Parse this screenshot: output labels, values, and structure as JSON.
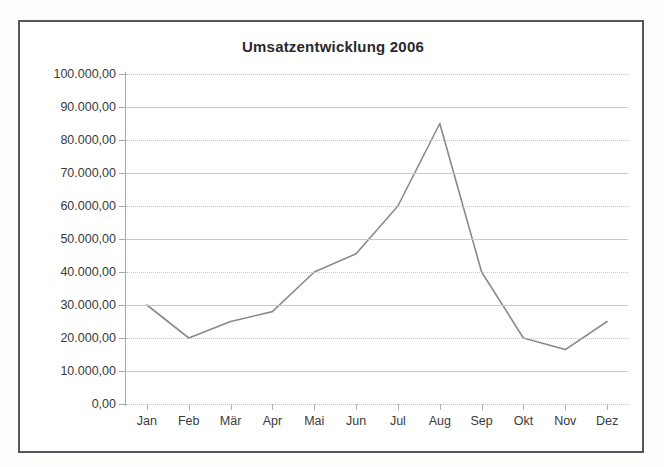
{
  "chart_data": {
    "type": "line",
    "title": "Umsatzentwicklung 2006",
    "xlabel": "",
    "ylabel": "",
    "categories": [
      "Jan",
      "Feb",
      "Mär",
      "Apr",
      "Mai",
      "Jun",
      "Jul",
      "Aug",
      "Sep",
      "Okt",
      "Nov",
      "Dez"
    ],
    "values": [
      30000,
      20000,
      25000,
      28000,
      40000,
      45500,
      60000,
      85000,
      40000,
      20000,
      16500,
      25000
    ],
    "series": [
      {
        "name": "Umsatz",
        "values": [
          30000,
          20000,
          25000,
          28000,
          40000,
          45500,
          60000,
          85000,
          40000,
          20000,
          16500,
          25000
        ]
      }
    ],
    "ylim": [
      0,
      100000
    ],
    "ytick_values": [
      0,
      10000,
      20000,
      30000,
      40000,
      50000,
      60000,
      70000,
      80000,
      90000,
      100000
    ],
    "ytick_labels": [
      "0,00",
      "10.000,00",
      "20.000,00",
      "30.000,00",
      "40.000,00",
      "50.000,00",
      "60.000,00",
      "70.000,00",
      "80.000,00",
      "90.000,00",
      "100.000,00"
    ],
    "grid": true,
    "legend": false,
    "legend_position": "none",
    "line_color": "#8a8a8a",
    "grid_color": "#c9c9c9",
    "frame_color": "#575757",
    "background": "#ffffff"
  },
  "chart": {
    "title": "Umsatzentwicklung 2006"
  },
  "caption": {
    "text": ""
  }
}
